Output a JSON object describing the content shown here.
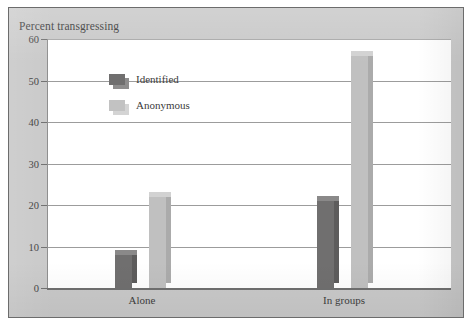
{
  "figure": {
    "title": "Percent transgressing",
    "background_color": "#C9C9C9",
    "plot_background_color": "#FFFFFF",
    "border_color": "#6C6C6C"
  },
  "legend": {
    "position": "inside-top-left",
    "entries": [
      {
        "label": "Identified",
        "color": "#706F6F"
      },
      {
        "label": "Anonymous",
        "color": "#C0C0C0"
      }
    ]
  },
  "chart_data": {
    "type": "bar",
    "title": "Percent transgressing",
    "xlabel": "",
    "ylabel": "Percent transgressing",
    "categories": [
      "Alone",
      "In groups"
    ],
    "series": [
      {
        "name": "Identified",
        "color": "#706F6F",
        "values": [
          8,
          21
        ]
      },
      {
        "name": "Anonymous",
        "color": "#C0C0C0",
        "values": [
          22,
          56
        ]
      }
    ],
    "ylim": [
      0,
      60
    ],
    "yticks": [
      0,
      10,
      20,
      30,
      40,
      50,
      60
    ],
    "ytick_labels": [
      "0",
      "10",
      "20",
      "30",
      "40",
      "50",
      "60"
    ],
    "grid": true,
    "grid_axis": "y",
    "legend_position": "inside-top-left"
  }
}
